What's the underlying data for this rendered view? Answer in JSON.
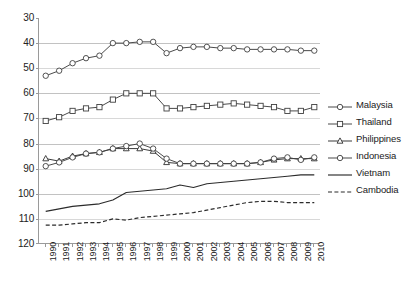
{
  "chart_data": {
    "type": "line",
    "title": "",
    "subtitle": "",
    "xlabel": "",
    "ylabel": "",
    "x": [
      1990,
      1991,
      1992,
      1993,
      1994,
      1995,
      1996,
      1997,
      1998,
      1999,
      2000,
      2001,
      2002,
      2003,
      2004,
      2005,
      2006,
      2007,
      2008,
      2009,
      2010
    ],
    "xtick_labels": [
      "1990",
      "1991",
      "1992",
      "1993",
      "1994",
      "1995",
      "1996",
      "1997",
      "1998",
      "1999",
      "2000",
      "2001",
      "2002",
      "2003",
      "2004",
      "2005",
      "2006",
      "2007",
      "2008",
      "2009",
      "2010"
    ],
    "ytick_labels": [
      "30",
      "40",
      "50",
      "60",
      "70",
      "80",
      "90",
      "100",
      "110",
      "120"
    ],
    "ylim": [
      30,
      120
    ],
    "y_inverted": true,
    "grid": true,
    "grid_axis": "y",
    "legend_position": "right",
    "series": [
      {
        "name": "Malaysia",
        "marker": "circle-open",
        "line_style": "solid",
        "color": "#404040",
        "values": [
          53,
          51,
          48,
          46,
          45,
          40,
          40,
          39.5,
          39.5,
          44,
          42,
          41.5,
          41.5,
          42,
          42,
          42.5,
          42.5,
          42.5,
          42.5,
          43,
          43
        ]
      },
      {
        "name": "Thailand",
        "marker": "square-open",
        "line_style": "solid",
        "color": "#404040",
        "values": [
          71,
          69.5,
          67,
          66,
          65.5,
          62.5,
          60,
          60,
          60,
          66,
          66,
          65.5,
          65,
          64.5,
          64,
          64.5,
          65,
          65.5,
          67,
          67,
          65.5
        ]
      },
      {
        "name": "Philippines",
        "marker": "triangle-open",
        "line_style": "solid",
        "color": "#303030",
        "values": [
          86,
          87,
          85,
          84,
          83.5,
          82,
          82,
          82,
          83,
          87.5,
          88,
          88,
          88,
          88,
          88,
          88,
          87.5,
          86.5,
          86,
          86,
          86
        ]
      },
      {
        "name": "Indonesia",
        "marker": "circle-open",
        "line_style": "solid",
        "color": "#404040",
        "values": [
          89,
          87.5,
          85.5,
          84,
          83.5,
          82,
          81,
          80,
          82,
          86,
          88,
          88,
          88,
          88,
          88,
          88,
          87.5,
          86,
          85.5,
          86.5,
          85.5
        ]
      },
      {
        "name": "Vietnam",
        "marker": "none",
        "line_style": "solid",
        "color": "#2b2b2b",
        "values": [
          107,
          106,
          105,
          104.5,
          104,
          102.5,
          99.5,
          99,
          98.5,
          98,
          96.5,
          97.5,
          96,
          95.5,
          95,
          94.5,
          94,
          93.5,
          93,
          92.5,
          92.5
        ]
      },
      {
        "name": "Cambodia",
        "marker": "none",
        "line_style": "dashed",
        "color": "#2b2b2b",
        "values": [
          112.5,
          112.5,
          112,
          111.5,
          111.5,
          110,
          110.5,
          109.5,
          109,
          108.5,
          108,
          107.5,
          106.5,
          105.5,
          104.5,
          103.5,
          103,
          103,
          103.5,
          103.5,
          103.5
        ]
      }
    ]
  },
  "legend": {
    "items": [
      {
        "label": "Malaysia"
      },
      {
        "label": "Thailand"
      },
      {
        "label": "Philippines"
      },
      {
        "label": "Indonesia"
      },
      {
        "label": "Vietnam"
      },
      {
        "label": "Cambodia"
      }
    ]
  }
}
